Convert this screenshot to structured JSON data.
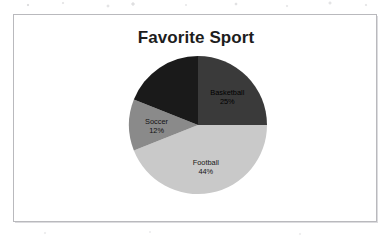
{
  "document": {
    "type": "scanned-page",
    "background_color": "#ffffff",
    "frame_border_color": "#b9b9bd"
  },
  "chart_data": {
    "type": "pie",
    "title": "Favorite Sport",
    "xlabel": "",
    "ylabel": "",
    "legend": "none",
    "labels_position": "inside-slices",
    "start_angle_deg": 0,
    "direction": "clockwise",
    "categories": [
      "Basketball",
      "Football",
      "Soccer",
      "Baseball"
    ],
    "values": [
      25,
      44,
      12,
      19
    ],
    "value_unit": "percent",
    "colors": [
      "#3a3a3a",
      "#c9c9c9",
      "#8a8a8a",
      "#1a1a1a"
    ],
    "slices": [
      {
        "name": "Basketball",
        "label": "Basketball",
        "percent_text": "25%",
        "value": 25,
        "color": "#3a3a3a",
        "label_visible": true
      },
      {
        "name": "Football",
        "label": "Football",
        "percent_text": "44%",
        "value": 44,
        "color": "#c9c9c9",
        "label_visible": true
      },
      {
        "name": "Soccer",
        "label": "Soccer",
        "percent_text": "12%",
        "value": 12,
        "color": "#8a8a8a",
        "label_visible": true
      },
      {
        "name": "unreadable-dark-slice",
        "label": "",
        "percent_text": "",
        "value": 19,
        "color": "#1a1a1a",
        "label_visible": false,
        "note": "label illegible - dark text printed on near-black fill"
      }
    ]
  }
}
